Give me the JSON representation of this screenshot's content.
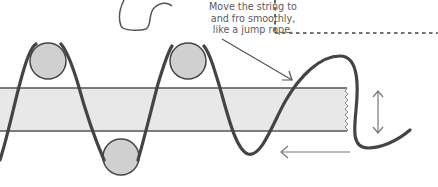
{
  "diagram": {
    "caption": {
      "lines": [
        "Move the string to",
        "and fro smoothly,",
        "like a jump rope."
      ]
    },
    "elements": {
      "strip": {
        "label": "band",
        "fill": "#e8e8e8",
        "stroke": "#555555"
      },
      "pegs": [
        {
          "name": "peg-top-left",
          "cx": 52,
          "cy": 61,
          "r": 18
        },
        {
          "name": "peg-top-right",
          "cx": 187,
          "cy": 61,
          "r": 18
        },
        {
          "name": "peg-bottom",
          "cx": 120,
          "cy": 157,
          "r": 18
        }
      ],
      "peg_fill": "#d0d0d0",
      "string_color": "#444444",
      "arrow_color": "#777777",
      "dashed_border_color": "#444444"
    },
    "annotations": {
      "pointer_arrow": "points from caption to string",
      "vertical_arrow": "up-down motion",
      "horizontal_arrow": "leftward motion"
    }
  }
}
